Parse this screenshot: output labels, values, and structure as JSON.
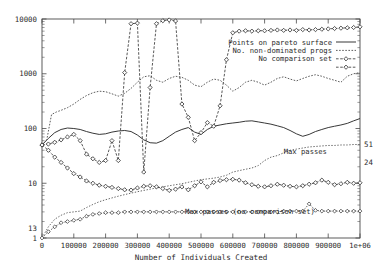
{
  "chart_data": {
    "type": "line",
    "title": "",
    "xlabel": "Number of Individuals Created",
    "ylabel": "",
    "xscale": "linear",
    "yscale": "log",
    "xlim": [
      0,
      1000000
    ],
    "ylim": [
      1,
      10000
    ],
    "grid": false,
    "legend_position": "upper-right-inside",
    "xticks": [
      0,
      100000,
      200000,
      300000,
      400000,
      500000,
      600000,
      700000,
      800000,
      900000,
      1000000
    ],
    "xticklabels": [
      "0",
      "100000",
      "200000",
      "300000",
      "400000",
      "500000",
      "600000",
      "700000",
      "800000",
      "900000",
      "1e+06"
    ],
    "yticks": [
      1,
      10,
      100,
      1000,
      10000
    ],
    "yticklabels": [
      "1",
      "10",
      "100",
      "1000",
      "10000"
    ],
    "extra_yticklabels": [
      {
        "value": 13,
        "label": "13"
      }
    ],
    "end_labels": [
      {
        "label": "51",
        "y_value": 51,
        "series": "Max passes"
      },
      {
        "label": "24",
        "y_value": 24,
        "series": "Max passes (no comparison set)"
      }
    ],
    "annotations": [
      {
        "text": "Max passes",
        "x": 760000,
        "y_value": 38
      },
      {
        "text": "Max passes (no comparison set)",
        "x": 450000,
        "y_value": 3.1
      }
    ],
    "legend_entries": [
      {
        "label": "Points on pareto surface",
        "style": "solid",
        "marker": "none"
      },
      {
        "label": "No. non-dominated progs",
        "style": "dotted",
        "marker": "none"
      },
      {
        "label": "No comparison set",
        "style": "dashed",
        "marker": "diamond"
      },
      {
        "label": "",
        "style": "dashed",
        "marker": "diamond"
      }
    ],
    "series": [
      {
        "name": "Points on pareto surface",
        "style": "solid",
        "marker": "none",
        "x": [
          0,
          20000,
          40000,
          60000,
          80000,
          100000,
          120000,
          140000,
          160000,
          180000,
          200000,
          220000,
          240000,
          260000,
          280000,
          300000,
          320000,
          340000,
          360000,
          380000,
          400000,
          420000,
          440000,
          460000,
          480000,
          500000,
          520000,
          540000,
          560000,
          580000,
          600000,
          620000,
          640000,
          660000,
          680000,
          700000,
          720000,
          740000,
          760000,
          780000,
          800000,
          820000,
          840000,
          860000,
          880000,
          900000,
          920000,
          940000,
          960000,
          980000,
          1000000
        ],
        "y": [
          50,
          66,
          84,
          96,
          102,
          100,
          96,
          88,
          82,
          78,
          80,
          86,
          90,
          92,
          88,
          76,
          62,
          55,
          54,
          60,
          72,
          86,
          96,
          104,
          86,
          78,
          96,
          110,
          116,
          122,
          126,
          130,
          136,
          138,
          132,
          126,
          120,
          112,
          104,
          92,
          80,
          72,
          78,
          88,
          96,
          104,
          110,
          116,
          124,
          138,
          152
        ]
      },
      {
        "name": "No. non-dominated progs",
        "style": "dotted",
        "marker": "none",
        "x": [
          0,
          15000,
          30000,
          45000,
          60000,
          80000,
          100000,
          120000,
          140000,
          160000,
          180000,
          200000,
          220000,
          240000,
          260000,
          280000,
          300000,
          320000,
          340000,
          360000,
          380000,
          400000,
          420000,
          440000,
          460000,
          480000,
          500000,
          520000,
          540000,
          560000,
          580000,
          600000,
          620000,
          640000,
          660000,
          680000,
          700000,
          720000,
          740000,
          760000,
          780000,
          800000,
          820000,
          840000,
          860000,
          880000,
          900000,
          920000,
          940000,
          960000,
          980000,
          1000000
        ],
        "y": [
          50,
          62,
          180,
          200,
          215,
          240,
          280,
          340,
          400,
          450,
          480,
          470,
          430,
          390,
          440,
          540,
          700,
          880,
          920,
          760,
          700,
          820,
          900,
          860,
          760,
          620,
          580,
          700,
          800,
          760,
          620,
          480,
          560,
          700,
          760,
          700,
          620,
          700,
          820,
          880,
          800,
          740,
          820,
          900,
          960,
          900,
          820,
          760,
          700,
          900,
          1000,
          1050
        ]
      },
      {
        "name": "No comparison set (upper, spiking)",
        "style": "dashed",
        "marker": "diamond",
        "x": [
          0,
          20000,
          40000,
          60000,
          80000,
          100000,
          120000,
          140000,
          160000,
          180000,
          200000,
          220000,
          240000,
          260000,
          280000,
          300000,
          320000,
          340000,
          360000,
          380000,
          400000,
          420000,
          440000,
          460000,
          480000,
          500000,
          520000,
          540000,
          560000,
          580000,
          600000,
          620000,
          640000,
          660000,
          680000,
          700000,
          720000,
          740000,
          760000,
          780000,
          800000,
          820000,
          840000,
          860000,
          880000,
          900000,
          920000,
          940000,
          960000,
          980000,
          1000000
        ],
        "y": [
          50,
          52,
          56,
          62,
          70,
          78,
          60,
          34,
          28,
          24,
          26,
          60,
          26,
          1050,
          8200,
          8400,
          16,
          560,
          8200,
          9300,
          9600,
          9200,
          280,
          160,
          60,
          84,
          128,
          110,
          260,
          1800,
          5600,
          6000,
          6100,
          6000,
          6100,
          6100,
          6200,
          6300,
          6200,
          6300,
          6200,
          6400,
          6300,
          6400,
          6500,
          6600,
          6700,
          6800,
          6900,
          7000,
          7200
        ]
      },
      {
        "name": "Max passes",
        "style": "dotted",
        "marker": "none",
        "x": [
          0,
          20000,
          40000,
          60000,
          80000,
          100000,
          120000,
          140000,
          160000,
          180000,
          200000,
          220000,
          240000,
          260000,
          280000,
          300000,
          320000,
          340000,
          360000,
          380000,
          400000,
          420000,
          440000,
          460000,
          480000,
          500000,
          520000,
          540000,
          560000,
          580000,
          600000,
          620000,
          640000,
          660000,
          680000,
          700000,
          720000,
          740000,
          760000,
          780000,
          800000,
          820000,
          840000,
          860000,
          880000,
          900000,
          920000,
          940000,
          960000,
          980000,
          1000000
        ],
        "y": [
          1,
          1.6,
          2.2,
          2.6,
          2.9,
          3.0,
          3.1,
          3.6,
          4.1,
          4.6,
          5.0,
          5.4,
          5.8,
          6.2,
          6.6,
          7.0,
          7.4,
          7.8,
          8.2,
          8.6,
          9.0,
          9.4,
          9.8,
          10.4,
          11,
          11.6,
          12,
          12.4,
          13,
          14,
          16,
          17,
          18,
          19,
          21,
          26,
          30,
          32,
          36,
          40,
          42,
          44,
          46,
          47,
          48,
          49,
          49,
          50,
          50,
          51,
          51
        ]
      },
      {
        "name": "No comparison set (lower)",
        "style": "dashed",
        "marker": "diamond",
        "x": [
          0,
          20000,
          40000,
          60000,
          80000,
          100000,
          120000,
          140000,
          160000,
          180000,
          200000,
          220000,
          240000,
          260000,
          280000,
          300000,
          320000,
          340000,
          360000,
          380000,
          400000,
          420000,
          440000,
          460000,
          480000,
          500000,
          520000,
          540000,
          560000,
          580000,
          600000,
          620000,
          640000,
          660000,
          680000,
          700000,
          720000,
          740000,
          760000,
          780000,
          800000,
          820000,
          840000,
          860000,
          880000,
          900000,
          920000,
          940000,
          960000,
          980000,
          1000000
        ],
        "y": [
          50,
          40,
          30,
          24,
          19,
          15,
          13,
          11,
          10,
          9.2,
          8.8,
          8.4,
          8.0,
          7.6,
          7.5,
          8.2,
          8.8,
          9.0,
          8.6,
          8.0,
          7.4,
          7.8,
          8.6,
          7.6,
          9.0,
          10.6,
          8.6,
          10.4,
          11.2,
          11.6,
          11.8,
          11.4,
          10.2,
          9.4,
          8.8,
          8.6,
          9.0,
          9.6,
          9.2,
          8.8,
          8.6,
          9.0,
          9.6,
          10.2,
          11.4,
          10.4,
          9.4,
          9.8,
          10.4,
          10.0,
          10.2
        ]
      },
      {
        "name": "Max passes (no comparison set)",
        "style": "dotted",
        "marker": "diamond-open",
        "x": [
          0,
          20000,
          40000,
          60000,
          80000,
          100000,
          120000,
          140000,
          160000,
          180000,
          200000,
          220000,
          240000,
          260000,
          280000,
          300000,
          320000,
          340000,
          360000,
          380000,
          400000,
          420000,
          440000,
          460000,
          480000,
          500000,
          520000,
          540000,
          560000,
          580000,
          600000,
          620000,
          640000,
          660000,
          680000,
          700000,
          720000,
          740000,
          760000,
          780000,
          800000,
          820000,
          840000,
          860000,
          880000,
          900000,
          920000,
          940000,
          960000,
          980000,
          1000000
        ],
        "y": [
          1,
          1.3,
          1.6,
          1.9,
          2.0,
          2.1,
          2.2,
          2.5,
          2.7,
          2.8,
          2.9,
          2.9,
          2.9,
          3.0,
          3.0,
          3.0,
          3.0,
          3.0,
          3.0,
          3.0,
          3.0,
          3.0,
          3.0,
          3.0,
          3.0,
          3.0,
          3.0,
          3.0,
          3.0,
          3.0,
          3.0,
          3.0,
          3.0,
          3.0,
          3.0,
          3.0,
          3.0,
          3.0,
          3.1,
          3.1,
          3.1,
          3.1,
          4.2,
          3.2,
          3.1,
          3.1,
          3.1,
          3.1,
          3.1,
          3.1,
          3.1
        ]
      }
    ]
  }
}
